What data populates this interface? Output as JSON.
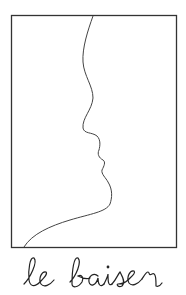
{
  "artwork": {
    "title": "le baiser",
    "style": "single-line profile drawing in rectangular frame",
    "stroke_color": "#333333",
    "background": "#ffffff"
  }
}
